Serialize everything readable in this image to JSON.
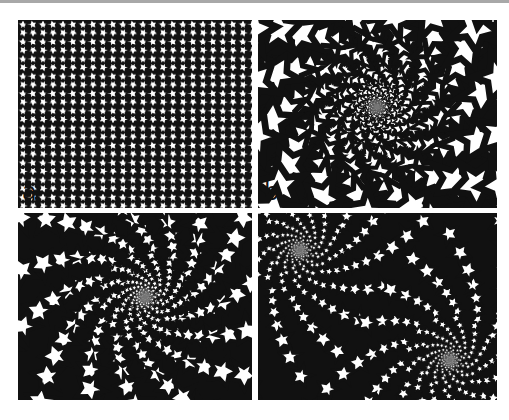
{
  "figure": {
    "panels": [
      {
        "id": "a",
        "label": "a",
        "type": "uniform tiling",
        "box": [
          18,
          20,
          234,
          188
        ]
      },
      {
        "id": "b",
        "label": "b",
        "type": "single spiral tiling (large tiles, center)",
        "box": [
          258,
          20,
          239,
          188
        ],
        "centers": [
          [
            119,
            87
          ]
        ]
      },
      {
        "id": "c",
        "label": "c",
        "type": "single spiral tiling (off-center)",
        "box": [
          18,
          213,
          234,
          187
        ],
        "centers": [
          [
            127,
            84
          ]
        ]
      },
      {
        "id": "d",
        "label": "d",
        "type": "double spiral tiling",
        "box": [
          258,
          213,
          239,
          187
        ],
        "centers": [
          [
            42,
            37
          ],
          [
            192,
            147
          ]
        ]
      }
    ]
  },
  "colors": {
    "ink": "#111111",
    "paper": "#ffffff",
    "topbar": "#a8a8a8"
  }
}
